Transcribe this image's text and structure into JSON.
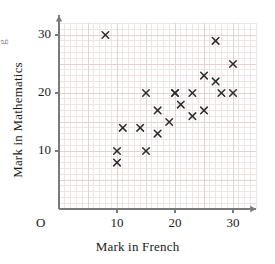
{
  "chart_data": {
    "type": "scatter",
    "title": "",
    "xlabel": "Mark in French",
    "ylabel": "Mark in Mathematics",
    "origin_label": "O",
    "xlim": [
      0,
      34
    ],
    "ylim": [
      0,
      32
    ],
    "xticks": [
      10,
      20,
      30
    ],
    "yticks": [
      10,
      20,
      30
    ],
    "xtick_labels": [
      "10",
      "20",
      "30"
    ],
    "ytick_labels": [
      "10",
      "20",
      "30"
    ],
    "grid": true,
    "grid_minor_step": 1,
    "grid_major_step": 5,
    "marker": "x",
    "marker_color": "#2b2b2b",
    "grid_color": "#f0e4e4",
    "grid_major_color": "#e2d2d2",
    "axis_color": "#7a7a7a",
    "legend": null,
    "clipped_label_fragment": "g",
    "points": [
      {
        "x": 8,
        "y": 30
      },
      {
        "x": 10,
        "y": 10
      },
      {
        "x": 10,
        "y": 8
      },
      {
        "x": 11,
        "y": 14
      },
      {
        "x": 14,
        "y": 14
      },
      {
        "x": 15,
        "y": 10
      },
      {
        "x": 15,
        "y": 20
      },
      {
        "x": 17,
        "y": 13
      },
      {
        "x": 17,
        "y": 17
      },
      {
        "x": 19,
        "y": 15
      },
      {
        "x": 20,
        "y": 20
      },
      {
        "x": 21,
        "y": 18
      },
      {
        "x": 23,
        "y": 16
      },
      {
        "x": 23,
        "y": 20
      },
      {
        "x": 25,
        "y": 23
      },
      {
        "x": 25,
        "y": 17
      },
      {
        "x": 27,
        "y": 29
      },
      {
        "x": 27,
        "y": 22
      },
      {
        "x": 28,
        "y": 20
      },
      {
        "x": 30,
        "y": 25
      },
      {
        "x": 30,
        "y": 20
      },
      {
        "x": 20,
        "y": 20
      }
    ]
  }
}
